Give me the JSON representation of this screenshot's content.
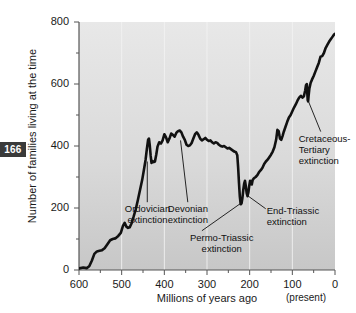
{
  "page_number": "166",
  "chart_data": {
    "type": "line",
    "title": "",
    "xlabel": "Millions of years ago",
    "ylabel": "Number of families living at the time",
    "xlim": [
      600,
      0
    ],
    "ylim": [
      0,
      800
    ],
    "x_reversed": true,
    "grid": "faint vertical white gridlines on gray background",
    "legend": "none",
    "x_ticks": [
      600,
      500,
      400,
      300,
      200,
      100,
      0
    ],
    "x_tick_labels": [
      "600",
      "500",
      "400",
      "300",
      "200",
      "100",
      "0"
    ],
    "x_minor_ticks": [
      550,
      450,
      350,
      250,
      150,
      50
    ],
    "y_ticks": [
      0,
      200,
      400,
      600,
      800
    ],
    "y_tick_labels": [
      "0",
      "200",
      "400",
      "600",
      "800"
    ],
    "y_minor_ticks": [
      100,
      300,
      500,
      700
    ],
    "x_axis_note": "(present)",
    "series": [
      {
        "name": "Number of families",
        "points": [
          [
            600,
            5
          ],
          [
            590,
            8
          ],
          [
            582,
            6
          ],
          [
            576,
            12
          ],
          [
            570,
            30
          ],
          [
            564,
            52
          ],
          [
            558,
            60
          ],
          [
            552,
            62
          ],
          [
            546,
            64
          ],
          [
            540,
            70
          ],
          [
            533,
            84
          ],
          [
            527,
            96
          ],
          [
            521,
            100
          ],
          [
            515,
            102
          ],
          [
            508,
            110
          ],
          [
            502,
            120
          ],
          [
            497,
            142
          ],
          [
            493,
            152
          ],
          [
            489,
            140
          ],
          [
            485,
            136
          ],
          [
            481,
            138
          ],
          [
            477,
            150
          ],
          [
            472,
            172
          ],
          [
            467,
            196
          ],
          [
            462,
            226
          ],
          [
            457,
            258
          ],
          [
            452,
            290
          ],
          [
            448,
            322
          ],
          [
            444,
            355
          ],
          [
            441,
            390
          ],
          [
            438,
            420
          ],
          [
            436,
            424
          ],
          [
            434,
            400
          ],
          [
            432,
            368
          ],
          [
            430,
            345
          ],
          [
            428,
            352
          ],
          [
            425,
            348
          ],
          [
            422,
            350
          ],
          [
            419,
            372
          ],
          [
            416,
            398
          ],
          [
            412,
            412
          ],
          [
            408,
            408
          ],
          [
            404,
            418
          ],
          [
            400,
            438
          ],
          [
            396,
            428
          ],
          [
            392,
            412
          ],
          [
            388,
            424
          ],
          [
            384,
            440
          ],
          [
            380,
            436
          ],
          [
            376,
            430
          ],
          [
            372,
            442
          ],
          [
            368,
            448
          ],
          [
            364,
            450
          ],
          [
            360,
            444
          ],
          [
            356,
            430
          ],
          [
            352,
            420
          ],
          [
            348,
            404
          ],
          [
            344,
            400
          ],
          [
            340,
            402
          ],
          [
            336,
            410
          ],
          [
            332,
            424
          ],
          [
            328,
            438
          ],
          [
            324,
            444
          ],
          [
            320,
            436
          ],
          [
            316,
            424
          ],
          [
            312,
            418
          ],
          [
            308,
            422
          ],
          [
            304,
            426
          ],
          [
            300,
            420
          ],
          [
            296,
            416
          ],
          [
            292,
            418
          ],
          [
            288,
            412
          ],
          [
            284,
            408
          ],
          [
            280,
            412
          ],
          [
            276,
            410
          ],
          [
            272,
            404
          ],
          [
            268,
            400
          ],
          [
            264,
            398
          ],
          [
            260,
            400
          ],
          [
            256,
            396
          ],
          [
            252,
            392
          ],
          [
            248,
            394
          ],
          [
            244,
            390
          ],
          [
            240,
            386
          ],
          [
            236,
            382
          ],
          [
            232,
            380
          ],
          [
            229,
            370
          ],
          [
            227,
            330
          ],
          [
            225,
            280
          ],
          [
            223,
            236
          ],
          [
            221,
            212
          ],
          [
            219,
            215
          ],
          [
            217,
            232
          ],
          [
            215,
            258
          ],
          [
            213,
            278
          ],
          [
            211,
            288
          ],
          [
            209,
            270
          ],
          [
            207,
            248
          ],
          [
            205,
            238
          ],
          [
            203,
            250
          ],
          [
            201,
            272
          ],
          [
            199,
            288
          ],
          [
            197,
            286
          ],
          [
            195,
            276
          ],
          [
            193,
            290
          ],
          [
            190,
            296
          ],
          [
            186,
            300
          ],
          [
            182,
            306
          ],
          [
            178,
            316
          ],
          [
            174,
            322
          ],
          [
            170,
            330
          ],
          [
            166,
            342
          ],
          [
            162,
            350
          ],
          [
            158,
            356
          ],
          [
            154,
            364
          ],
          [
            150,
            372
          ],
          [
            146,
            382
          ],
          [
            142,
            396
          ],
          [
            138,
            420
          ],
          [
            135,
            452
          ],
          [
            132,
            448
          ],
          [
            129,
            424
          ],
          [
            126,
            420
          ],
          [
            123,
            432
          ],
          [
            120,
            446
          ],
          [
            116,
            462
          ],
          [
            112,
            478
          ],
          [
            108,
            492
          ],
          [
            104,
            500
          ],
          [
            100,
            512
          ],
          [
            96,
            524
          ],
          [
            92,
            534
          ],
          [
            88,
            546
          ],
          [
            84,
            556
          ],
          [
            80,
            562
          ],
          [
            76,
            556
          ],
          [
            73,
            560
          ],
          [
            70,
            578
          ],
          [
            68,
            596
          ],
          [
            66,
            600
          ],
          [
            65,
            572
          ],
          [
            64,
            548
          ],
          [
            63,
            544
          ],
          [
            62,
            560
          ],
          [
            60,
            586
          ],
          [
            57,
            604
          ],
          [
            54,
            614
          ],
          [
            50,
            626
          ],
          [
            46,
            640
          ],
          [
            42,
            654
          ],
          [
            38,
            668
          ],
          [
            34,
            688
          ],
          [
            30,
            690
          ],
          [
            26,
            700
          ],
          [
            22,
            716
          ],
          [
            18,
            726
          ],
          [
            14,
            736
          ],
          [
            10,
            744
          ],
          [
            6,
            752
          ],
          [
            3,
            758
          ],
          [
            0,
            762
          ]
        ]
      }
    ],
    "annotations": [
      {
        "id": "ordovician",
        "lines": [
          "Ordovician",
          "extinction"
        ],
        "label_x": 440,
        "label_y": 180,
        "point_x": 440,
        "point_y": 350
      },
      {
        "id": "devonian",
        "lines": [
          "Devonian",
          "extinction"
        ],
        "label_x": 345,
        "label_y": 180,
        "point_x": 362,
        "point_y": 418
      },
      {
        "id": "permo-triassic",
        "lines": [
          "Permo-Triassic",
          "extinction"
        ],
        "label_x": 265,
        "label_y": 88,
        "point_x": 222,
        "point_y": 214
      },
      {
        "id": "end-triassic",
        "lines": [
          "End-Triassic",
          "extinction"
        ],
        "label_x": 160,
        "label_y": 175,
        "point_x": 205,
        "point_y": 240
      },
      {
        "id": "cretaceous-tertiary",
        "lines": [
          "Cretaceous-",
          "Tertiary",
          "extinction"
        ],
        "label_x": 85,
        "label_y": 390,
        "point_x": 64,
        "point_y": 550
      }
    ]
  },
  "colors": {
    "plot_background_top": "#e6e6e6",
    "plot_background_bottom": "#c9c9c9",
    "line": "#111111",
    "axis": "#5a5a5a",
    "gridline": "#f2f2f2",
    "text": "#1a1a1a",
    "badge_background": "#3a3a3a",
    "badge_text": "#ffffff"
  }
}
